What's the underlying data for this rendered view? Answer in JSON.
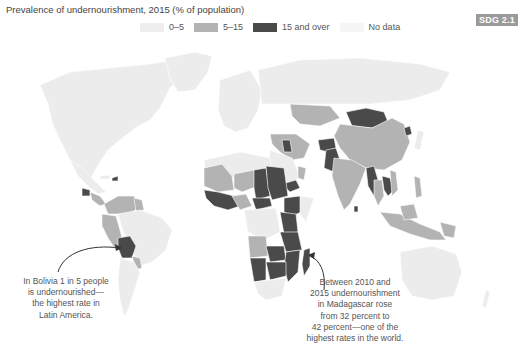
{
  "title": "Prevalence of undernourishment, 2015 (% of population)",
  "badge": "SDG 2.1",
  "legend": [
    {
      "label": "0–5",
      "color": "#eeeeee"
    },
    {
      "label": "5–15",
      "color": "#b3b3b3"
    },
    {
      "label": "15 and over",
      "color": "#4a4a4a"
    },
    {
      "label": "No data",
      "color": "#f5f5f5"
    }
  ],
  "colors": {
    "low": "#ececec",
    "mid": "#b3b3b3",
    "high": "#4a4a4a",
    "nodata": "#f4f4f4",
    "border": "#ffffff",
    "arrow": "#333333"
  },
  "annotations": {
    "bolivia": {
      "lines": [
        "In Bolivia 1 in 5 people",
        "is undernourished—",
        "the highest rate in",
        "Latin America."
      ]
    },
    "madagascar": {
      "lines": [
        "Between 2010 and",
        "2015 undernourishment",
        "in Madagascar rose",
        "from 32 percent to",
        "42 percent—one of the",
        "highest rates in the world."
      ]
    }
  },
  "regions_highlighted": {
    "high": [
      "Bolivia",
      "Haiti",
      "Guatemala",
      "Chad",
      "Sudan",
      "Ethiopia",
      "Kenya",
      "Tanzania",
      "Zambia",
      "Zimbabwe",
      "Mozambique",
      "Madagascar",
      "Namibia",
      "Botswana",
      "Central African Republic",
      "Yemen",
      "Iraq",
      "Afghanistan",
      "Pakistan",
      "Mongolia",
      "North Korea",
      "Myanmar",
      "Cambodia",
      "Uganda",
      "Rwanda",
      "Liberia",
      "Sierra Leone"
    ],
    "mid": [
      "Mexico",
      "Colombia",
      "Venezuela",
      "Peru",
      "Ecuador",
      "Paraguay",
      "Mauritania",
      "Mali",
      "Niger",
      "Nigeria",
      "Angola",
      "Iran",
      "India",
      "China",
      "Thailand",
      "Indonesia",
      "Philippines",
      "Papua New Guinea",
      "Kazakhstan",
      "Oman"
    ]
  }
}
